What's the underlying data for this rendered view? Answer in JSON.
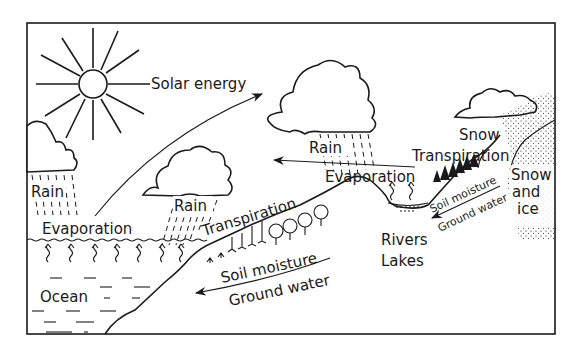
{
  "diagram": {
    "labels": {
      "solar_energy": "Solar energy",
      "rain_left": "Rain",
      "rain_middle": "Rain",
      "rain_right": "Rain",
      "evaporation_ocean": "Evaporation",
      "evaporation_lake": "Evaporation",
      "transpiration_middle": "Transpiration",
      "transpiration_right": "Transpiration",
      "snow": "Snow",
      "snow_and_ice_1": "Snow",
      "snow_and_ice_2": "and",
      "snow_and_ice_3": "ice",
      "ocean": "Ocean",
      "soil_moisture_middle": "Soil moisture",
      "ground_water_middle": "Ground water",
      "soil_moisture_right": "Soil moisture",
      "ground_water_right": "Ground water",
      "rivers": "Rivers",
      "lakes": "Lakes"
    },
    "colors": {
      "ink": "#1a1a1a",
      "paper": "#ffffff"
    }
  }
}
